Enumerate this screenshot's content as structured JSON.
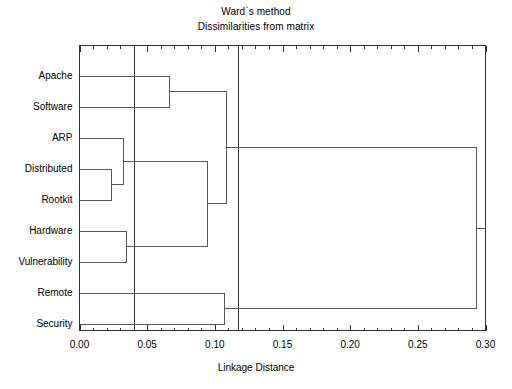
{
  "figure": {
    "title_line1": "Ward`s method",
    "title_line2": "Dissimilarities from matrix",
    "background_color": "#ffffff",
    "line_color": "#555555",
    "frame_color": "#333333"
  },
  "axis": {
    "x_title": "Linkage Distance",
    "tick_labels": [
      "0.00",
      "0.05",
      "0.10",
      "0.15",
      "0.20",
      "0.25",
      "0.30"
    ]
  },
  "chart_data": {
    "type": "line",
    "subtype": "dendrogram",
    "title": "Ward`s method\nDissimilarities from matrix",
    "xlabel": "Linkage Distance",
    "ylabel": "",
    "xlim": [
      0.0,
      0.3
    ],
    "xticks": [
      0.0,
      0.05,
      0.1,
      0.15,
      0.2,
      0.25,
      0.3
    ],
    "minor_tick_step": 0.01,
    "grid": false,
    "legend": "none",
    "orientation": "horizontal",
    "leaves": [
      "Apache",
      "Software",
      "ARP",
      "Distributed",
      "Rootkit",
      "Hardware",
      "Vulnerability",
      "Remote",
      "Security"
    ],
    "merges": [
      {
        "id": "m1",
        "left": "Distributed",
        "right": "Rootkit",
        "distance": 0.023
      },
      {
        "id": "m2",
        "left": "Hardware",
        "right": "Vulnerability",
        "distance": 0.034
      },
      {
        "id": "m3",
        "left": "ARP",
        "right": "m1",
        "distance": 0.032
      },
      {
        "id": "m4",
        "left": "Apache",
        "right": "Software",
        "distance": 0.066
      },
      {
        "id": "m5",
        "left": "m3",
        "right": "m2",
        "distance": 0.094
      },
      {
        "id": "m6",
        "left": "Remote",
        "right": "Security",
        "distance": 0.107
      },
      {
        "id": "m7",
        "left": "m4",
        "right": "m5",
        "distance": 0.108
      },
      {
        "id": "m8",
        "left": "m7",
        "right": "m6",
        "distance": 0.293
      }
    ],
    "cut_lines": [
      0.04,
      0.117
    ],
    "annotations": []
  }
}
